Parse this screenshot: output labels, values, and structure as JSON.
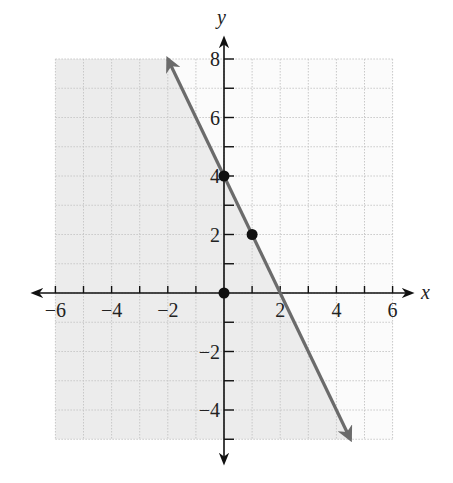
{
  "chart_data": {
    "type": "line",
    "title": "",
    "xlabel": "x",
    "ylabel": "y",
    "xlim": [
      -6,
      6
    ],
    "ylim": [
      -5,
      8
    ],
    "grid": true,
    "x_ticks": [
      -6,
      -4,
      -2,
      2,
      4,
      6
    ],
    "y_ticks": [
      -4,
      -2,
      2,
      4,
      6,
      8
    ],
    "x_tick_labels": [
      "−6",
      "−4",
      "−2",
      "2",
      "4",
      "6"
    ],
    "y_tick_labels": [
      "−4",
      "−2",
      "2",
      "4",
      "6",
      "8"
    ],
    "line": {
      "equation": "y = -2x + 4",
      "slope": -2,
      "intercept": 4,
      "x_start": -2,
      "y_start": 8,
      "x_end": 4.5,
      "y_end": -5,
      "arrows": "both",
      "color": "#6b6b6b"
    },
    "shaded_region": {
      "description": "half-plane below/left of line (y <= -2x + 4)",
      "color": "#ececec"
    },
    "points": [
      {
        "x": 0,
        "y": 4
      },
      {
        "x": 1,
        "y": 2
      },
      {
        "x": 0,
        "y": 0
      }
    ]
  },
  "labels": {
    "x_axis": "x",
    "y_axis": "y"
  }
}
